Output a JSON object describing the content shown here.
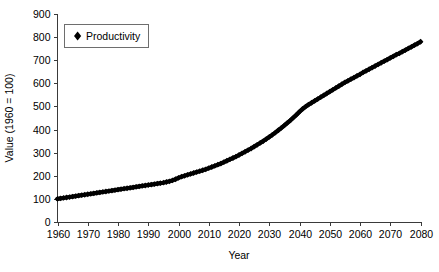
{
  "chart_data": {
    "type": "line",
    "title": "",
    "xlabel": "Year",
    "ylabel": "Value (1960 = 100)",
    "xlim": [
      1960,
      2080
    ],
    "ylim": [
      0,
      900
    ],
    "xticks": [
      1960,
      1970,
      1980,
      1990,
      2000,
      2010,
      2020,
      2030,
      2040,
      2050,
      2060,
      2070,
      2080
    ],
    "yticks": [
      0,
      100,
      200,
      300,
      400,
      500,
      600,
      700,
      800,
      900
    ],
    "grid": false,
    "legend_position": "top-left",
    "marker": "diamond",
    "series_color": "#000000",
    "series": [
      {
        "name": "Productivity",
        "x": [
          1960,
          1961,
          1962,
          1963,
          1964,
          1965,
          1966,
          1967,
          1968,
          1969,
          1970,
          1971,
          1972,
          1973,
          1974,
          1975,
          1976,
          1977,
          1978,
          1979,
          1980,
          1981,
          1982,
          1983,
          1984,
          1985,
          1986,
          1987,
          1988,
          1989,
          1990,
          1991,
          1992,
          1993,
          1994,
          1995,
          1996,
          1997,
          1998,
          1999,
          2000,
          2001,
          2002,
          2003,
          2004,
          2005,
          2006,
          2007,
          2008,
          2009,
          2010,
          2011,
          2012,
          2013,
          2014,
          2015,
          2016,
          2017,
          2018,
          2019,
          2020,
          2021,
          2022,
          2023,
          2024,
          2025,
          2026,
          2027,
          2028,
          2029,
          2030,
          2031,
          2032,
          2033,
          2034,
          2035,
          2036,
          2037,
          2038,
          2039,
          2040,
          2041,
          2042,
          2043,
          2044,
          2045,
          2046,
          2047,
          2048,
          2049,
          2050,
          2051,
          2052,
          2053,
          2054,
          2055,
          2056,
          2057,
          2058,
          2059,
          2060,
          2061,
          2062,
          2063,
          2064,
          2065,
          2066,
          2067,
          2068,
          2069,
          2070,
          2071,
          2072,
          2073,
          2074,
          2075,
          2076,
          2077,
          2078,
          2079,
          2080
        ],
        "values": [
          100,
          102,
          104,
          106,
          108,
          110,
          112,
          114,
          116,
          118,
          120,
          122,
          124,
          126,
          128,
          130,
          132,
          134,
          136,
          138,
          140,
          142,
          144,
          146,
          148,
          150,
          152,
          154,
          156,
          158,
          160,
          162,
          164,
          166,
          168,
          170,
          173,
          176,
          180,
          185,
          191,
          196,
          200,
          204,
          208,
          212,
          216,
          220,
          224,
          228,
          233,
          238,
          243,
          248,
          253,
          259,
          265,
          271,
          277,
          283,
          290,
          297,
          304,
          311,
          318,
          326,
          334,
          342,
          350,
          359,
          368,
          377,
          387,
          397,
          407,
          418,
          429,
          440,
          452,
          464,
          477,
          489,
          499,
          508,
          516,
          524,
          532,
          540,
          548,
          556,
          564,
          572,
          580,
          588,
          596,
          604,
          611,
          618,
          625,
          632,
          639,
          647,
          654,
          661,
          668,
          675,
          682,
          689,
          696,
          703,
          710,
          717,
          724,
          730,
          737,
          744,
          751,
          758,
          765,
          772,
          780
        ]
      }
    ]
  },
  "legend": {
    "entries": [
      {
        "label": "Productivity",
        "marker": "diamond",
        "color": "#000000"
      }
    ]
  },
  "axes": {
    "x_title": "Year",
    "y_title": "Value (1960 = 100)",
    "x_tick_labels": [
      "1960",
      "1970",
      "1980",
      "1990",
      "2000",
      "2010",
      "2020",
      "2030",
      "2040",
      "2050",
      "2060",
      "2070",
      "2080"
    ],
    "y_tick_labels": [
      "0",
      "100",
      "200",
      "300",
      "400",
      "500",
      "600",
      "700",
      "800",
      "900"
    ]
  }
}
